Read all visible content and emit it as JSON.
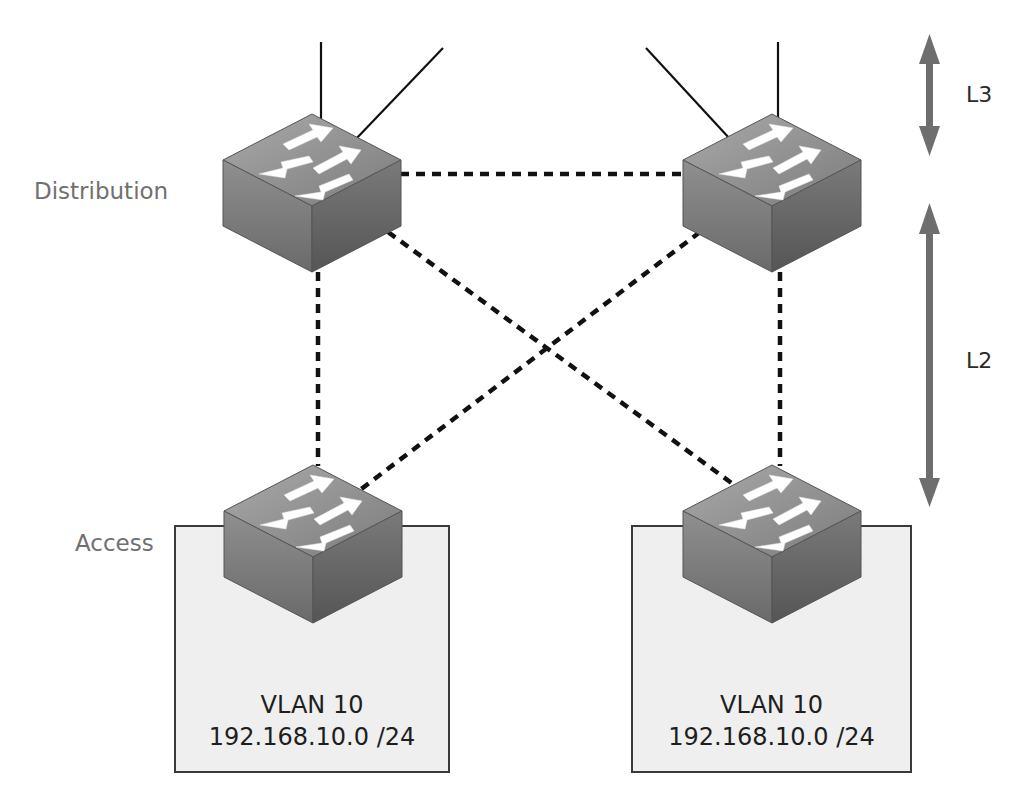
{
  "tiers": {
    "distribution_label": "Distribution",
    "access_label": "Access"
  },
  "layers": {
    "l3_label": "L3",
    "l2_label": "L2"
  },
  "vlans": [
    {
      "name": "VLAN 10",
      "subnet": "192.168.10.0 /24"
    },
    {
      "name": "VLAN 10",
      "subnet": "192.168.10.0 /24"
    }
  ],
  "switches": [
    {
      "role": "distribution",
      "position": "left",
      "icon": "switch-icon"
    },
    {
      "role": "distribution",
      "position": "right",
      "icon": "switch-icon"
    },
    {
      "role": "access",
      "position": "left",
      "icon": "switch-icon"
    },
    {
      "role": "access",
      "position": "right",
      "icon": "switch-icon"
    }
  ],
  "links": {
    "uplinks_style": "solid",
    "l2_links_style": "dashed"
  },
  "colors": {
    "switch_top": "#8c8c8c",
    "switch_left": "#7a7a7a",
    "switch_right": "#5e5e5e",
    "arrow_gray": "#707070",
    "vlan_fill": "#efefef",
    "link": "#111111"
  }
}
